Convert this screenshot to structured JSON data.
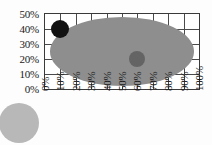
{
  "chart_data": {
    "type": "scatter",
    "title": "",
    "subtitle": "",
    "xlabel": "",
    "ylabel": "",
    "xlim": [
      0,
      100
    ],
    "ylim": [
      0,
      50
    ],
    "grid": true,
    "legend": "none",
    "x_tick_labels": [
      "0%",
      "10%",
      "20%",
      "30%",
      "40%",
      "50%",
      "60%",
      "70%",
      "80%",
      "90%",
      "100%"
    ],
    "y_tick_labels": [
      "0%",
      "10%",
      "20%",
      "30%",
      "40%",
      "50%"
    ],
    "x_ticks": [
      0,
      10,
      20,
      30,
      40,
      50,
      60,
      70,
      80,
      90,
      100
    ],
    "y_ticks": [
      0,
      10,
      20,
      30,
      40,
      50
    ],
    "x_tick_label_rotation": 90,
    "series": [
      {
        "name": "region-ellipse",
        "shape": "ellipse",
        "center": [
          50,
          25
        ],
        "width": 94,
        "height": 46,
        "color": "#8e8e8e"
      },
      {
        "name": "marker-a",
        "shape": "circle",
        "x": 10,
        "y": 40,
        "radius_px": 9,
        "color": "#121212"
      },
      {
        "name": "marker-b",
        "shape": "circle",
        "x": 60,
        "y": 20,
        "radius_px": 8,
        "color": "#646464"
      }
    ],
    "decorations": [
      {
        "name": "corner-circle",
        "shape": "circle",
        "color": "#b8b8b8",
        "clipped": true
      }
    ],
    "colors": {
      "plot_background": "#ffffff",
      "page_background": "#fdfdfd",
      "grid": "#4a4a4a",
      "axis": "#3a3a3a",
      "ellipse_fill": "#8e8e8e",
      "marker_dark": "#121212",
      "marker_mid": "#646464",
      "corner_blob": "#b8b8b8",
      "text": "#1a1a1a"
    }
  }
}
